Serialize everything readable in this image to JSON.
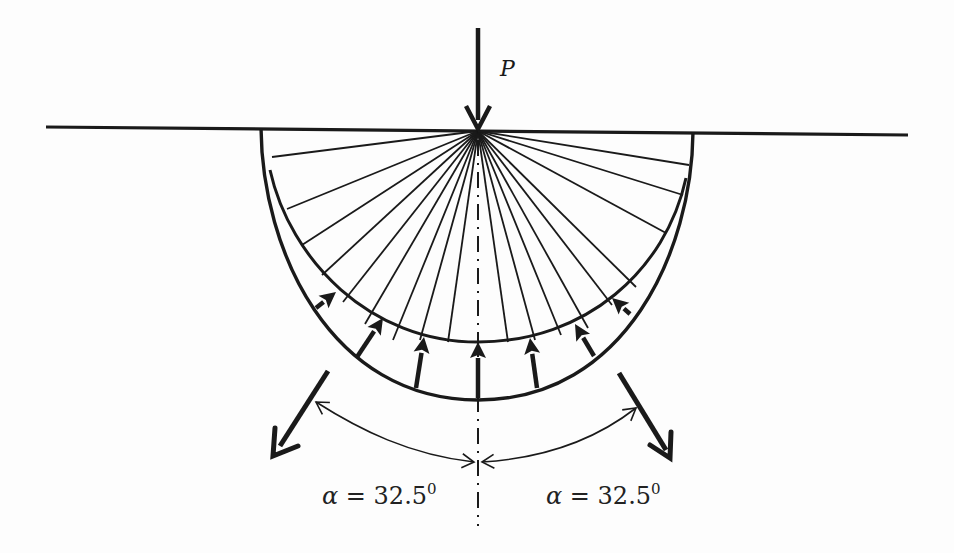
{
  "diagram": {
    "load": {
      "label": "P",
      "icon": "down-arrow-icon"
    },
    "angles": [
      {
        "side": "left",
        "symbol": "α",
        "equals": " = ",
        "value": "32.5",
        "superscript": "0"
      },
      {
        "side": "right",
        "symbol": "α",
        "equals": " = ",
        "value": "32.5",
        "superscript": "0"
      }
    ],
    "geometry": {
      "apex": [
        478,
        131
      ],
      "ground_line": [
        [
          46,
          127
        ],
        [
          908,
          135
        ]
      ],
      "load_arrow": [
        [
          478,
          28
        ],
        [
          478,
          131
        ]
      ],
      "outer_curve_bottom": [
        478,
        400
      ],
      "inner_curve_bottom": [
        478,
        342
      ],
      "radial_line_count": 21,
      "reaction_arrow_count": 7,
      "outward_arrows": [
        [
          [
            328,
            371
          ],
          [
            274,
            455
          ]
        ],
        [
          [
            619,
            373
          ],
          [
            671,
            458
          ]
        ]
      ]
    },
    "colors": {
      "ink": "#1a1a1a",
      "background": "#fdfdfd"
    }
  }
}
